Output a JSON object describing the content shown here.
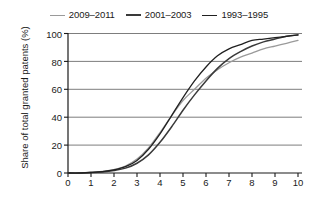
{
  "chart_data": {
    "type": "line",
    "title": "",
    "xlabel": "Years after filling",
    "ylabel": "Share of total granted patents (%)",
    "xlim": [
      0,
      10
    ],
    "ylim": [
      0,
      100
    ],
    "xticks": [
      0,
      1,
      2,
      3,
      4,
      5,
      6,
      7,
      8,
      9,
      10
    ],
    "yticks": [
      0,
      20,
      40,
      60,
      80,
      100
    ],
    "grid": "horizontal",
    "legend_position": "top-center",
    "x": [
      0,
      0.5,
      1,
      1.5,
      2,
      2.5,
      3,
      3.5,
      4,
      4.5,
      5,
      5.5,
      6,
      6.5,
      7,
      7.5,
      8,
      8.5,
      9,
      9.5,
      10
    ],
    "series": [
      {
        "name": "2009-2011",
        "color": "#9a9a9a",
        "width": 1.3,
        "values": [
          0,
          0,
          0.4,
          1.2,
          2.5,
          5,
          10,
          18,
          29,
          41,
          52,
          60,
          68,
          74,
          79,
          83,
          86,
          89,
          91,
          93,
          95
        ]
      },
      {
        "name": "2001-2003",
        "color": "#3a3a3a",
        "width": 1.5,
        "values": [
          0,
          0,
          0.3,
          0.8,
          1.8,
          3.5,
          7,
          13,
          22,
          33,
          45,
          56,
          66,
          75,
          82,
          87,
          91,
          94,
          96,
          98,
          99
        ]
      },
      {
        "name": "1993-1995",
        "color": "#202020",
        "width": 1.3,
        "values": [
          0,
          0,
          0.4,
          1.0,
          2.2,
          4.5,
          9,
          17,
          28,
          41,
          54,
          66,
          76,
          84,
          89,
          92,
          95,
          96,
          97,
          98,
          99
        ]
      }
    ]
  },
  "legend": {
    "entries": [
      {
        "label": "2009–2011"
      },
      {
        "label": "2001–2003"
      },
      {
        "label": "1993–1995"
      }
    ]
  },
  "axes": {
    "y_title": "Share of total granted patents (%)",
    "x_title": "Years after filling",
    "y_tick_labels": [
      "100",
      "80",
      "60",
      "40",
      "20",
      "0"
    ],
    "x_tick_labels": [
      "0",
      "1",
      "2",
      "3",
      "4",
      "5",
      "6",
      "7",
      "8",
      "9",
      "10"
    ]
  },
  "colors": {
    "axis": "#1a1a1a",
    "grid": "#6e6e6e",
    "background": "#ffffff"
  }
}
